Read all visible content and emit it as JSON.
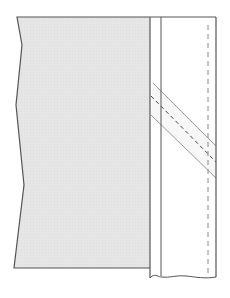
{
  "diagram": {
    "type": "sewing-construction-illustration",
    "colors": {
      "background": "#ffffff",
      "fabric_fill": "#e6e6e6",
      "outline": "#555555",
      "strip_outline": "#9a9a9a",
      "stitch": "#444444",
      "stitch_light": "#888888"
    },
    "elements": [
      {
        "name": "fabric-panel",
        "fill": "shaded"
      },
      {
        "name": "vertical-band",
        "fill": "white"
      },
      {
        "name": "band-fold-line"
      },
      {
        "name": "bias-strip",
        "orientation": "diagonal"
      },
      {
        "name": "bias-strip-stitch-line",
        "style": "dashed"
      },
      {
        "name": "band-stitch-line",
        "style": "dashed",
        "orientation": "vertical"
      }
    ]
  }
}
